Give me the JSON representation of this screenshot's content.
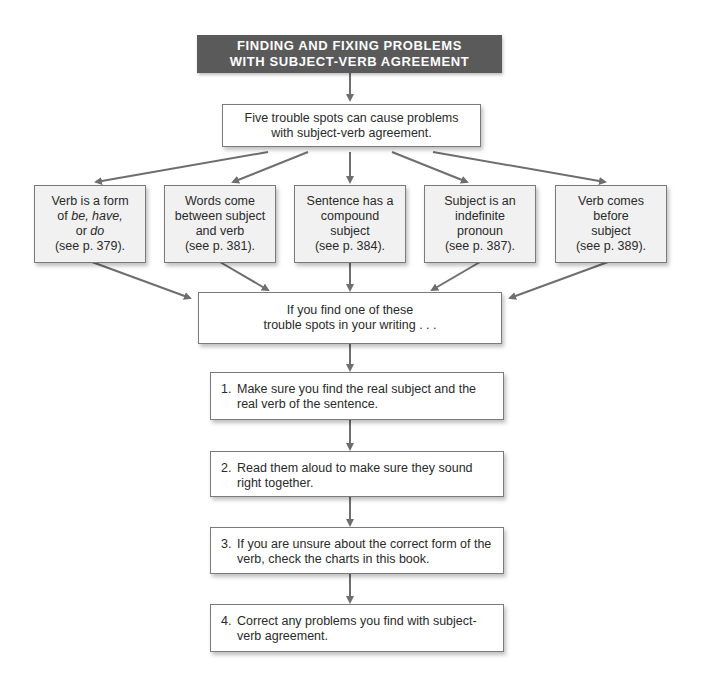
{
  "title": {
    "line1": "FINDING AND FIXING PROBLEMS",
    "line2": "WITH SUBJECT-VERB AGREEMENT"
  },
  "intro": {
    "line1": "Five trouble spots can cause problems",
    "line2": "with subject-verb agreement."
  },
  "trouble_spots": [
    {
      "line1": "Verb is a form",
      "line2_pre": "of ",
      "line2_italic_a": "be, have,",
      "line3_pre": "or ",
      "line3_italic": "do",
      "ref": "(see p. 379)."
    },
    {
      "line1": "Words come",
      "line2": "between subject",
      "line3": "and verb",
      "ref": "(see p. 381)."
    },
    {
      "line1": "Sentence has a",
      "line2": "compound",
      "line3": "subject",
      "ref": "(see p. 384)."
    },
    {
      "line1": "Subject is an",
      "line2": "indefinite",
      "line3": "pronoun",
      "ref": "(see p. 387)."
    },
    {
      "line1": "Verb comes",
      "line2": "before",
      "line3": "subject",
      "ref": "(see p. 389)."
    }
  ],
  "if_box": {
    "line1": "If you find one of these",
    "line2": "trouble spots in your writing . . ."
  },
  "steps": [
    {
      "num": "1.",
      "text": "Make sure you find the real subject and the real verb of the sentence."
    },
    {
      "num": "2.",
      "text": "Read them aloud to make sure they sound right together."
    },
    {
      "num": "3.",
      "text": "If you are unsure about the correct form of the verb, check the charts in this book."
    },
    {
      "num": "4.",
      "text": "Correct any problems you find with subject-verb agreement."
    }
  ],
  "colors": {
    "title_bg": "#5a5a5a",
    "box_border": "#7a7a7a",
    "arrow": "#6e6e6e",
    "trouble_bg": "#f1f1f1"
  }
}
